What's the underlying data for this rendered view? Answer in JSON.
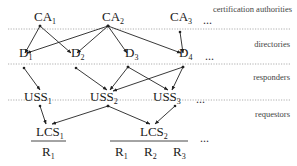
{
  "layers": [
    {
      "id": "ca",
      "label": "certification authorities",
      "line_y": null,
      "label_y": 13
    },
    {
      "id": "dir",
      "label": "directories",
      "line_y": 29,
      "label_y": 46
    },
    {
      "id": "resp",
      "label": "responders",
      "line_y": 64,
      "label_y": 78
    },
    {
      "id": "req",
      "label": "requestors",
      "line_y": 100,
      "label_y": 116
    }
  ],
  "nodes": {
    "CA1": {
      "base": "CA",
      "sub": "1",
      "x": 34,
      "y": 21,
      "dot": [
        40,
        26
      ]
    },
    "CA2": {
      "base": "CA",
      "sub": "2",
      "x": 102,
      "y": 21,
      "dot": [
        108,
        26
      ]
    },
    "CA3": {
      "base": "CA",
      "sub": "3",
      "x": 170,
      "y": 21,
      "dot": [
        181,
        31
      ]
    },
    "D1": {
      "base": "D",
      "sub": "1",
      "x": 19,
      "y": 57,
      "dot": [
        26,
        53
      ]
    },
    "D2": {
      "base": "D",
      "sub": "2",
      "x": 71,
      "y": 57,
      "dot": [
        76,
        53
      ]
    },
    "D3": {
      "base": "D",
      "sub": "3",
      "x": 125,
      "y": 57,
      "dot": [
        128,
        53
      ]
    },
    "D4": {
      "base": "D",
      "sub": "4",
      "x": 179,
      "y": 57,
      "dot": [
        183,
        53
      ]
    },
    "USS1": {
      "base": "USS",
      "sub": "1",
      "x": 24,
      "y": 101,
      "dot": [
        40,
        90
      ]
    },
    "USS2": {
      "base": "USS",
      "sub": "2",
      "x": 90,
      "y": 101,
      "dot": [
        108,
        90
      ]
    },
    "USS3": {
      "base": "USS",
      "sub": "3",
      "x": 153,
      "y": 101,
      "dot": [
        170,
        90
      ]
    },
    "LCS1": {
      "base": "LCS",
      "sub": "1",
      "x": 36,
      "y": 136,
      "dot": [
        48,
        124
      ]
    },
    "LCS2": {
      "base": "LCS",
      "sub": "2",
      "x": 140,
      "y": 136,
      "dot": [
        152,
        124
      ]
    }
  },
  "edges": [
    {
      "from": [
        40,
        26
      ],
      "to": [
        25,
        53
      ]
    },
    {
      "from": [
        40,
        26
      ],
      "to": [
        71,
        53
      ]
    },
    {
      "from": [
        108,
        26
      ],
      "to": [
        27,
        53
      ]
    },
    {
      "from": [
        108,
        26
      ],
      "to": [
        77,
        53
      ]
    },
    {
      "from": [
        108,
        26
      ],
      "to": [
        127,
        53
      ]
    },
    {
      "from": [
        108,
        26
      ],
      "to": [
        181,
        53
      ]
    },
    {
      "from": [
        180,
        32
      ],
      "to": [
        183,
        53
      ]
    },
    {
      "from": [
        24,
        68
      ],
      "to": [
        40,
        90
      ]
    },
    {
      "from": [
        76,
        68
      ],
      "to": [
        107,
        90
      ]
    },
    {
      "from": [
        128,
        67
      ],
      "to": [
        110,
        90
      ]
    },
    {
      "from": [
        128,
        67
      ],
      "to": [
        168,
        90
      ]
    },
    {
      "from": [
        183,
        67
      ],
      "to": [
        113,
        91
      ]
    },
    {
      "from": [
        183,
        67
      ],
      "to": [
        172,
        90
      ]
    },
    {
      "from": [
        40,
        106
      ],
      "to": [
        46,
        124
      ]
    },
    {
      "from": [
        108,
        106
      ],
      "to": [
        52,
        124
      ]
    },
    {
      "from": [
        108,
        106
      ],
      "to": [
        150,
        124
      ]
    },
    {
      "from": [
        175,
        106
      ],
      "to": [
        155,
        124
      ]
    }
  ],
  "ellipses": [
    {
      "x": 203,
      "y": 24,
      "text": "..."
    },
    {
      "x": 205,
      "y": 60,
      "text": "..."
    },
    {
      "x": 196,
      "y": 103,
      "text": "..."
    },
    {
      "x": 200,
      "y": 142,
      "text": "..."
    }
  ],
  "lcs_groups": [
    {
      "lcs": "LCS1",
      "bar": [
        31,
        66
      ],
      "bar_y": 141,
      "requestors": [
        {
          "base": "R",
          "sub": "1",
          "x": 42
        }
      ]
    },
    {
      "lcs": "LCS2",
      "bar": [
        110,
        188
      ],
      "bar_y": 141,
      "requestors": [
        {
          "base": "R",
          "sub": "1",
          "x": 115
        },
        {
          "base": "R",
          "sub": "2",
          "x": 144
        },
        {
          "base": "R",
          "sub": "3",
          "x": 173
        }
      ]
    }
  ],
  "labels": {
    "ca_layer": "certification authorities",
    "dir_layer": "directories",
    "resp_layer": "responders",
    "req_layer": "requestors",
    "ellipsis": "..."
  }
}
